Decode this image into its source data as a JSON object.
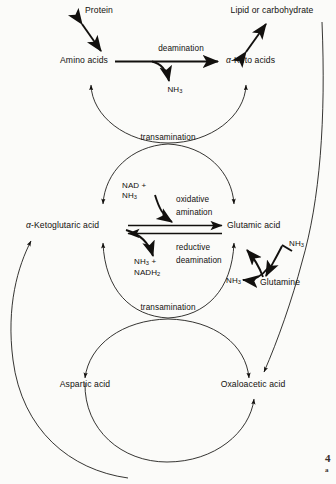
{
  "figure": {
    "type": "biochemical-pathway-diagram",
    "background_color": "#fbfbf9",
    "ink_color": "#12100e"
  },
  "nodes": {
    "protein": "Protein",
    "amino_acids": "Amino acids",
    "lipid_or_carbohydrate": "Lipid or carbohydrate",
    "keto_acids_alpha": "α",
    "keto_acids_rest": "-Keto acids",
    "ketoglutaric_alpha": "α",
    "ketoglutaric_rest": "-Ketoglutaric acid",
    "glutamic_acid": "Glutamic acid",
    "glutamine": "Glutamine",
    "aspartic_acid": "Aspartic acid",
    "oxaloacetic_acid": "Oxaloacetic acid"
  },
  "process_labels": {
    "deamination": "deamination",
    "transamination_upper": "transamination",
    "transamination_lower": "transamination",
    "oxidative": "oxidative",
    "amination": "amination",
    "reductive": "reductive",
    "deamination_lower": "deamination"
  },
  "molecules": {
    "nh3_deamination": {
      "base": "NH",
      "sub": "3"
    },
    "nad_plus": "NAD +",
    "nh3_substrate": {
      "base": "NH",
      "sub": "3"
    },
    "nh3_product": {
      "base": "NH",
      "sub": "3",
      "suffix": " +"
    },
    "nadh2_product": {
      "base": "NADH",
      "sub": "2"
    },
    "nh3_glutamine_in": {
      "base": "NH",
      "sub": "3"
    },
    "nh3_glutamine_out": {
      "base": "NH",
      "sub": "3"
    }
  },
  "caption": {
    "number": "4",
    "text": "a"
  }
}
